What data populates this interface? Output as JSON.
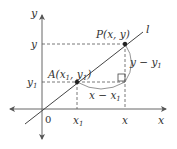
{
  "figure": {
    "type": "coordinate-geometry",
    "colors": {
      "axis": "#555555",
      "line": "#444444",
      "dashed": "#555555",
      "text": "#333333",
      "point": "#222222"
    }
  },
  "axes": {
    "x_label": "x",
    "y_label": "y",
    "origin_label": "0"
  },
  "line": {
    "label": "l"
  },
  "points": {
    "A": {
      "label_main": "A(x",
      "label_sub1": "1",
      "label_mid": ", y",
      "label_sub2": "1",
      "label_end": ")"
    },
    "P": {
      "label": "P(x, y)"
    }
  },
  "ticks": {
    "x1_main": "x",
    "x1_sub": "1",
    "x": "x",
    "y": "y",
    "y1_main": "y",
    "y1_sub": "1"
  },
  "measures": {
    "rise_main": "y − y",
    "rise_sub": "1",
    "run_main": "x − x",
    "run_sub": "1"
  }
}
